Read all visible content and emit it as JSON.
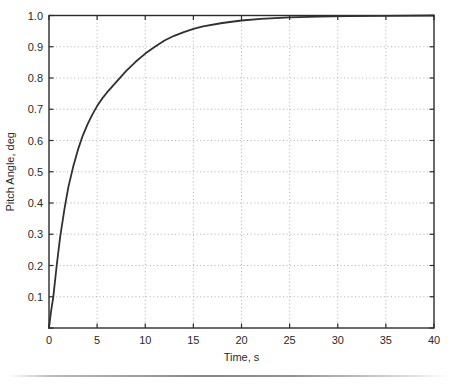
{
  "chart_data": {
    "type": "line",
    "title": "",
    "xlabel": "Time, s",
    "ylabel": "Pitch Angle, deg",
    "xlim": [
      0,
      40
    ],
    "ylim": [
      0,
      1.0
    ],
    "grid": "dotted",
    "legend": "none",
    "x_ticks": {
      "values": [
        0,
        5,
        10,
        15,
        20,
        25,
        30,
        35,
        40
      ],
      "labels": [
        "0",
        "5",
        "10",
        "15",
        "20",
        "25",
        "30",
        "35",
        "40"
      ]
    },
    "y_ticks": {
      "values": [
        0,
        0.1,
        0.2,
        0.3,
        0.4,
        0.5,
        0.6,
        0.7,
        0.8,
        0.9,
        1.0
      ],
      "labels": [
        "",
        "0.1",
        "0.2",
        "0.3",
        "0.4",
        "0.5",
        "0.6",
        "0.7",
        "0.8",
        "0.9",
        "1.0"
      ]
    },
    "series": [
      {
        "name": "pitch-angle-step-response",
        "points": [
          [
            0,
            0
          ],
          [
            0.2,
            0.05
          ],
          [
            0.45,
            0.1
          ],
          [
            0.8,
            0.2
          ],
          [
            1.15,
            0.29
          ],
          [
            1.6,
            0.38
          ],
          [
            2.0,
            0.45
          ],
          [
            2.5,
            0.515
          ],
          [
            3.0,
            0.57
          ],
          [
            3.5,
            0.615
          ],
          [
            4.0,
            0.652
          ],
          [
            4.5,
            0.683
          ],
          [
            5.0,
            0.71
          ],
          [
            5.5,
            0.733
          ],
          [
            6.0,
            0.753
          ],
          [
            7.0,
            0.788
          ],
          [
            8.0,
            0.822
          ],
          [
            9.0,
            0.852
          ],
          [
            10.0,
            0.878
          ],
          [
            11.0,
            0.9
          ],
          [
            12.0,
            0.92
          ],
          [
            13.0,
            0.935
          ],
          [
            14.0,
            0.947
          ],
          [
            15.0,
            0.957
          ],
          [
            16.0,
            0.965
          ],
          [
            18.0,
            0.976
          ],
          [
            20.0,
            0.984
          ],
          [
            22.0,
            0.989
          ],
          [
            25.0,
            0.994
          ],
          [
            28.0,
            0.9965
          ],
          [
            31.0,
            0.998
          ],
          [
            35.0,
            0.999
          ],
          [
            40.0,
            1.0
          ]
        ]
      }
    ],
    "colors": {
      "curve": "#303030",
      "axis": "#2b2b2b",
      "grid": "#b0b0b0",
      "text": "#2a2a2a",
      "background": "#ffffff",
      "page_rule": "#9a9a9a"
    }
  }
}
